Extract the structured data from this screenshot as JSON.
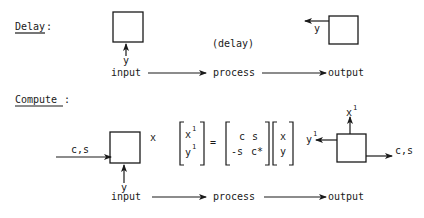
{
  "delay_section": {
    "label": "Delay",
    "label_colon": ":",
    "input_signal": "y",
    "output_signal": "y",
    "annotation": "(delay)",
    "flow": {
      "input": "input",
      "process": "process",
      "output": "output"
    }
  },
  "compute_section": {
    "label": "Compute",
    "label_colon": ":",
    "left_input": "c,s",
    "bottom_input": "y",
    "stored": "x",
    "equation": {
      "lhs": [
        [
          "x",
          "1"
        ],
        [
          "y",
          "1"
        ]
      ],
      "equals": "=",
      "matrix": [
        [
          "c",
          "s"
        ],
        [
          "-s",
          "c*"
        ]
      ],
      "vector": [
        "x",
        "y"
      ]
    },
    "outputs": {
      "top": {
        "base": "x",
        "sup": "1"
      },
      "left": {
        "base": "y",
        "sup": "1"
      },
      "right": "c,s"
    },
    "flow": {
      "input": "input",
      "process": "process",
      "output": "output"
    }
  }
}
